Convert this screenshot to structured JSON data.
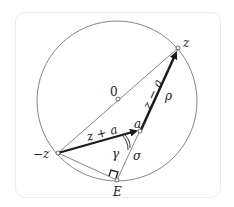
{
  "diagram": {
    "labels": {
      "z": "z",
      "neg_z": "−z",
      "origin": "0",
      "a": "a",
      "E": "E",
      "z_plus_a": "z + a",
      "z_minus_a": "z − a",
      "rho": "ρ",
      "sigma": "σ",
      "gamma": "γ"
    },
    "colors": {
      "line": "#555555",
      "arrow": "#1a1a1a",
      "text": "#222222"
    }
  }
}
